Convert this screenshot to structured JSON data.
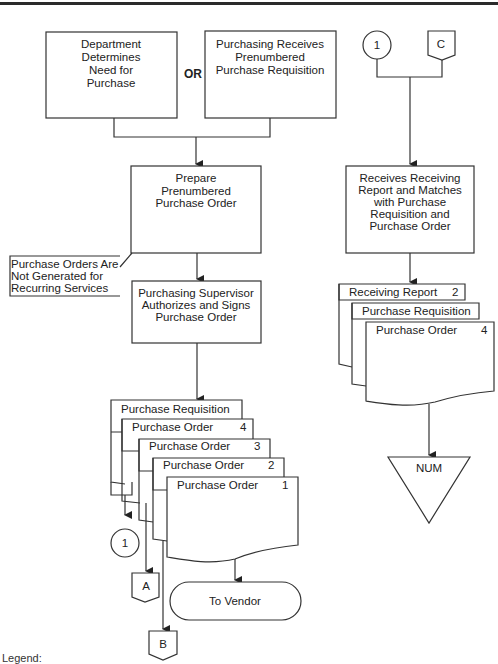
{
  "diagram": {
    "type": "document flowchart",
    "topbar_color": "#2a2a2a",
    "or_label": "OR",
    "processes": {
      "dept_determines": [
        "Department",
        "Determines",
        "Need for",
        "Purchase"
      ],
      "purchasing_receives": [
        "Purchasing Receives",
        "Prenumbered",
        "Purchase Requisition"
      ],
      "prepare_po": [
        "Prepare",
        "Prenumbered",
        "Purchase Order"
      ],
      "supervisor_authorizes": [
        "Purchasing Supervisor",
        "Authorizes and Signs",
        "Purchase Order"
      ],
      "receives_matches": [
        "Receives Receiving",
        "Report and Matches",
        "with Purchase",
        "Requisition and",
        "Purchase Order"
      ]
    },
    "annotation": [
      "Purchase Orders Are",
      "Not Generated for",
      "Recurring Services"
    ],
    "left_documents": [
      {
        "label": "Purchase Requisition",
        "copy": ""
      },
      {
        "label": "Purchase Order",
        "copy": "4"
      },
      {
        "label": "Purchase Order",
        "copy": "3"
      },
      {
        "label": "Purchase Order",
        "copy": "2"
      },
      {
        "label": "Purchase Order",
        "copy": "1"
      }
    ],
    "right_documents": [
      {
        "label": "Receiving Report",
        "copy": "2"
      },
      {
        "label": "Purchase Requisition",
        "copy": ""
      },
      {
        "label": "Purchase Order",
        "copy": "4"
      }
    ],
    "connectors": {
      "onpage_left": "1",
      "onpage_right": "1",
      "offpage_a": "A",
      "offpage_b": "B",
      "offpage_c": "C"
    },
    "terminal": "To Vendor",
    "file": "NUM",
    "legend_label": "Legend:"
  }
}
